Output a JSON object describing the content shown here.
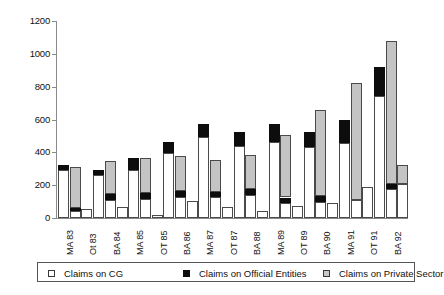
{
  "chart_data": {
    "type": "bar",
    "stacked": true,
    "title": "",
    "subtitle": "",
    "xlabel": "",
    "ylabel": "",
    "ylim": [
      0,
      1200
    ],
    "yticks": [
      0,
      200,
      400,
      600,
      800,
      1000,
      1200
    ],
    "ytick_labels": [
      "0",
      "200",
      "400",
      "600",
      "800",
      "1000",
      "1200"
    ],
    "grid": false,
    "legend_position": "bottom",
    "categories": [
      "MA 83",
      "Ot 83",
      "BA 84",
      "MA 85",
      "OT 85",
      "BA 86",
      "MA 87",
      "OT 87",
      "BA 88",
      "MA 89",
      "OT 89",
      "BA 90",
      "MA 91",
      "OT 91",
      "BA 92"
    ],
    "series": [
      {
        "name": "Claims on CG",
        "color": "#ffffff",
        "values": [
          295,
          40,
          265,
          110,
          65,
          335,
          115,
          130,
          130,
          45,
          85,
          80,
          90,
          185,
          175
        ]
      },
      {
        "name": "Claims on Official Entities",
        "color": "#0d0d0d",
        "values": [
          25,
          25,
          0,
          80,
          0,
          100,
          0,
          0,
          0,
          0,
          0,
          40,
          0,
          45,
          0
        ]
      },
      {
        "name": "Claims on Private Sector",
        "color": "#c4c4c4",
        "values": [
          0,
          245,
          0,
          0,
          0,
          0,
          0,
          0,
          0,
          0,
          0,
          0,
          0,
          0,
          0
        ]
      }
    ],
    "bars": [
      {
        "label": "MA 83",
        "cg": 295,
        "oe": 25,
        "ps": 0,
        "total": 320
      },
      {
        "label": "MA 83 b",
        "cg": 40,
        "oe": 20,
        "ps": 250,
        "total": 310
      },
      {
        "label": "Ot 83",
        "cg": 55,
        "oe": 0,
        "ps": 0,
        "total": 55
      },
      {
        "label": "BA 84",
        "cg": 265,
        "oe": 25,
        "ps": 0,
        "total": 290
      },
      {
        "label": "BA 84 b",
        "cg": 110,
        "oe": 35,
        "ps": 205,
        "total": 350
      },
      {
        "label": "MA 85",
        "cg": 70,
        "oe": 0,
        "ps": 0,
        "total": 70
      },
      {
        "label": "MA 85 b",
        "cg": 290,
        "oe": 75,
        "ps": 0,
        "total": 365
      },
      {
        "label": "OT 85",
        "cg": 115,
        "oe": 40,
        "ps": 210,
        "total": 365
      },
      {
        "label": "OT 85 b",
        "cg": 20,
        "oe": 0,
        "ps": 0,
        "total": 20
      },
      {
        "label": "BA 86",
        "cg": 395,
        "oe": 70,
        "ps": 0,
        "total": 465
      },
      {
        "label": "BA 86 b",
        "cg": 125,
        "oe": 40,
        "ps": 215,
        "total": 380
      },
      {
        "label": "MA 87",
        "cg": 105,
        "oe": 0,
        "ps": 0,
        "total": 105
      },
      {
        "label": "MA 87 b",
        "cg": 495,
        "oe": 80,
        "ps": 0,
        "total": 575
      },
      {
        "label": "OT 87",
        "cg": 130,
        "oe": 30,
        "ps": 195,
        "total": 355
      },
      {
        "label": "OT 87 b",
        "cg": 70,
        "oe": 0,
        "ps": 0,
        "total": 70
      },
      {
        "label": "BA 88",
        "cg": 440,
        "oe": 85,
        "ps": 0,
        "total": 525
      },
      {
        "label": "BA 88 b",
        "cg": 140,
        "oe": 35,
        "ps": 210,
        "total": 385
      },
      {
        "label": "MA 89",
        "cg": 45,
        "oe": 0,
        "ps": 0,
        "total": 45
      },
      {
        "label": "MA 89 b",
        "cg": 460,
        "oe": 115,
        "ps": 0,
        "total": 575
      },
      {
        "label": "OT 89",
        "cg": 90,
        "oe": 35,
        "ps": 380,
        "total": 505
      },
      {
        "label": "OT 89 b",
        "cg": 75,
        "oe": 0,
        "ps": 0,
        "total": 75
      },
      {
        "label": "BA 90",
        "cg": 430,
        "oe": 95,
        "ps": 0,
        "total": 525
      },
      {
        "label": "BA 90 b",
        "cg": 95,
        "oe": 40,
        "ps": 520,
        "total": 655
      },
      {
        "label": "MA 91",
        "cg": 90,
        "oe": 0,
        "ps": 0,
        "total": 90
      },
      {
        "label": "MA 91 b",
        "cg": 455,
        "oe": 140,
        "ps": 0,
        "total": 595
      },
      {
        "label": "OT 91",
        "cg": 110,
        "oe": 0,
        "ps": 715,
        "total": 825
      },
      {
        "label": "OT 91 b",
        "cg": 190,
        "oe": 0,
        "ps": 0,
        "total": 190
      },
      {
        "label": "BA 92",
        "cg": 745,
        "oe": 175,
        "ps": 0,
        "total": 920
      },
      {
        "label": "BA 92 b",
        "cg": 175,
        "oe": 30,
        "ps": 875,
        "total": 1080
      },
      {
        "label": "BA 92 c",
        "cg": 210,
        "oe": 0,
        "ps": 115,
        "total": 325
      }
    ]
  },
  "legend": {
    "items": [
      {
        "label": "Claims on CG",
        "swatch": "cg"
      },
      {
        "label": "Claims on Official Entities",
        "swatch": "oe"
      },
      {
        "label": "Claims on Private Sector",
        "swatch": "ps"
      }
    ]
  },
  "axis": {
    "y_labels": [
      "1200",
      "1000",
      "800",
      "600",
      "400",
      "200",
      "0"
    ],
    "x_labels": [
      "MA 83",
      "Ot 83",
      "BA 84",
      "MA 85",
      "OT 85",
      "BA 86",
      "MA 87",
      "OT 87",
      "BA 88",
      "MA 89",
      "OT 89",
      "BA 90",
      "MA 91",
      "OT 91",
      "BA 92"
    ]
  }
}
